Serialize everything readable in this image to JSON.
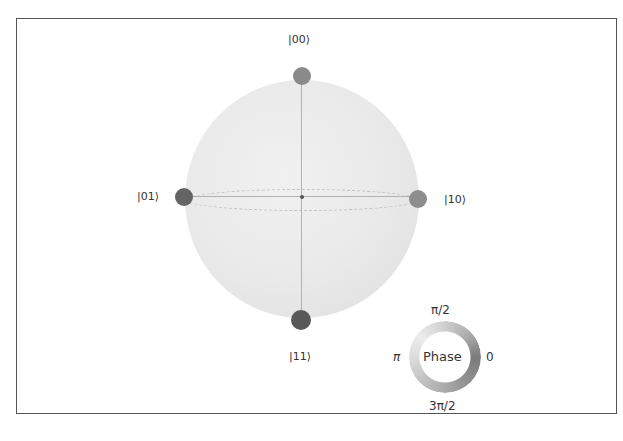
{
  "figure": {
    "type": "q-sphere",
    "states": [
      {
        "label": "|00⟩",
        "position": "top",
        "color": "#8a8a8a",
        "dot": {
          "x": 302,
          "y": 76,
          "r": 9
        },
        "label_pos": {
          "x": 288,
          "y": 33
        }
      },
      {
        "label": "|01⟩",
        "position": "left",
        "color": "#646464",
        "dot": {
          "x": 184,
          "y": 197,
          "r": 9
        },
        "label_pos": {
          "x": 137,
          "y": 190
        }
      },
      {
        "label": "|10⟩",
        "position": "right",
        "color": "#8d8d8d",
        "dot": {
          "x": 418,
          "y": 199,
          "r": 9
        },
        "label_pos": {
          "x": 444,
          "y": 193
        }
      },
      {
        "label": "|11⟩",
        "position": "bottom",
        "color": "#585858",
        "dot": {
          "x": 301,
          "y": 320,
          "r": 10
        },
        "label_pos": {
          "x": 289,
          "y": 350
        }
      }
    ],
    "phase_legend": {
      "title": "Phase",
      "ticks": {
        "top": "π/2",
        "left": "π",
        "right": "0",
        "bottom": "3π/2"
      },
      "ring_gradient": "conic-gradient(from 90deg, #7a7a7a 0deg, #8f8f8f 45deg, #b5b5b5 110deg, #dcdcdc 180deg, #ececec 220deg, #cfcfcf 270deg, #a9a9a9 320deg, #7a7a7a 360deg)"
    },
    "caption": ""
  },
  "colors": {
    "frame_border": "#555555",
    "sphere_fill": "#e9e9e9",
    "axis_line": "#9a9a9a",
    "text": "#333333"
  }
}
